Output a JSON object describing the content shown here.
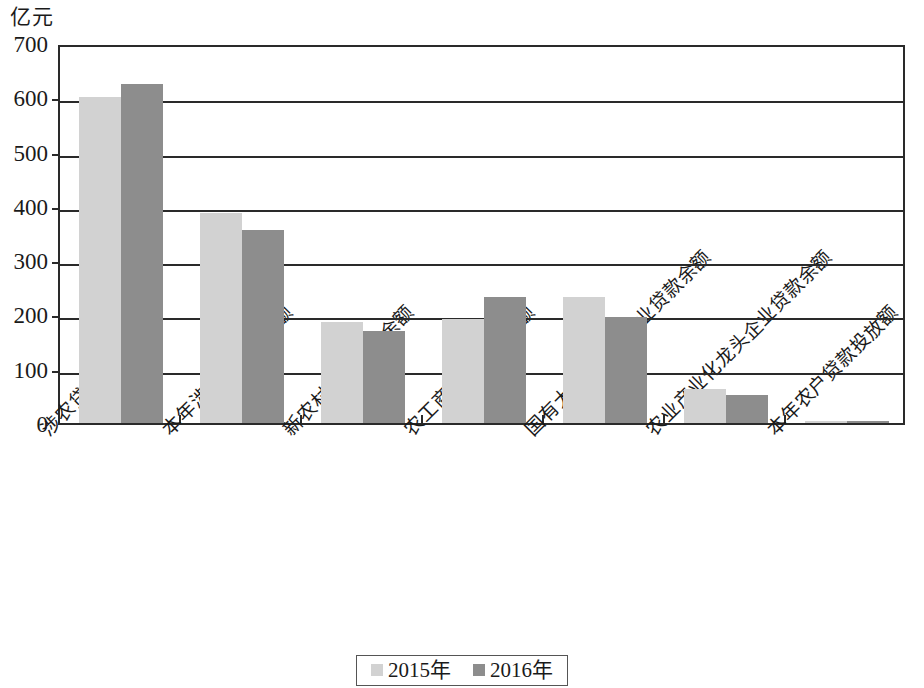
{
  "chart_data": {
    "type": "bar",
    "title": "",
    "subtitle": "",
    "xlabel": "",
    "ylabel": "亿元",
    "ylim": [
      0,
      700
    ],
    "ytick_step": 100,
    "yticks": [
      700,
      600,
      500,
      400,
      300,
      200,
      100,
      0
    ],
    "grid": true,
    "legend_position": "bottom",
    "categories": [
      "涉农贷款余额",
      "本年涉农贷款投放额",
      "新农村建设贷款余额",
      "农工商公司贷款余额",
      "国有大中型涉农企业贷款余额",
      "农业产业化龙头企业贷款余额",
      "本年农户贷款投放额"
    ],
    "series": [
      {
        "name": "2015年",
        "color": "#d2d2d2",
        "values": [
          600,
          387,
          186,
          192,
          233,
          62,
          3
        ]
      },
      {
        "name": "2016年",
        "color": "#8d8d8d",
        "values": [
          625,
          355,
          170,
          233,
          195,
          52,
          4
        ]
      }
    ]
  },
  "legend": {
    "items": [
      {
        "label": "2015年",
        "swatch": "legend-swatch-2015"
      },
      {
        "label": "2016年",
        "swatch": "legend-swatch-2016"
      }
    ]
  },
  "axis": {
    "y_unit_label": "亿元",
    "y_tick_labels": [
      "700",
      "600",
      "500",
      "400",
      "300",
      "200",
      "100",
      "0"
    ]
  },
  "colors": {
    "series_2015": "#d2d2d2",
    "series_2016": "#8d8d8d",
    "axis": "#2a2a2a",
    "background": "#ffffff"
  }
}
